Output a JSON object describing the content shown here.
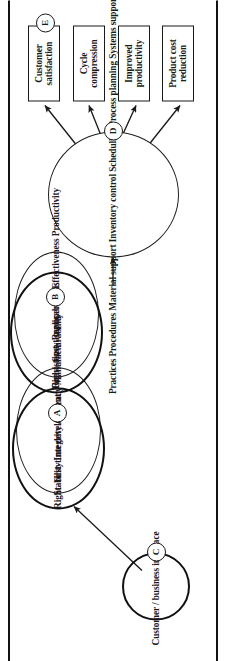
{
  "figure": {
    "orientation": "rotated-90-ccw",
    "ink_color": "#1a1a1a",
    "page_background": "#ffffff"
  },
  "outcomes": {
    "heading": "Business outcomes",
    "boxes": [
      {
        "id": "outcome-product-cost",
        "line1": "Product cost",
        "line2": "reduction"
      },
      {
        "id": "outcome-productivity",
        "line1": "Improved",
        "line2": "productivity"
      },
      {
        "id": "outcome-cycle",
        "line1": "Cycle",
        "line2": "compression"
      },
      {
        "id": "outcome-customer-sat",
        "line1": "Customer",
        "line2": "satisfaction"
      }
    ]
  },
  "badges": {
    "a": "A",
    "b": "B",
    "c": "C",
    "d": "D",
    "e": "E"
  },
  "nodes": {
    "support": {
      "id": "support-ellipse",
      "badge": "D",
      "items": [
        "Practices",
        "Procedures",
        "Material support",
        "Inventory control",
        "Scheduling",
        "Process planning",
        "Systems support"
      ]
    },
    "operations": {
      "id": "right-first-time-operations",
      "badge": "B",
      "line1": "Right-",
      "line2": "first-time",
      "line3": "operations"
    },
    "operations_attributes": {
      "id": "operations-attributes",
      "items": [
        "Consistency",
        "Replicability",
        "Effectiveness",
        "Productivity"
      ]
    },
    "development": {
      "id": "right-first-time-development",
      "badge": "A",
      "line1": "Right-",
      "line2": "first-time",
      "line3": "development"
    },
    "development_attributes": {
      "id": "development-attributes",
      "items": [
        "Stability",
        "Integrity",
        "Accuracy",
        "Manufacturability"
      ]
    },
    "interface": {
      "id": "customer-business-interface",
      "badge": "C",
      "line1": "Customer /",
      "line2": "business",
      "line3": "interface"
    }
  }
}
